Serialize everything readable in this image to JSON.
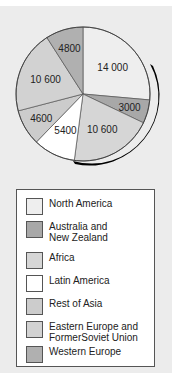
{
  "chart_data": {
    "type": "pie",
    "title": "",
    "categories": [
      "North America",
      "Australia and New Zealand",
      "Africa",
      "Latin America",
      "Rest of Asia",
      "Eastern Europe and FormerSoviet Union",
      "Western Europe"
    ],
    "values": [
      14000,
      3000,
      10600,
      5400,
      4600,
      10600,
      4800
    ],
    "labels": [
      "14 000",
      "3000",
      "10 600",
      "5400",
      "4600",
      "10 600",
      "4800"
    ],
    "colors": [
      "#eeeeee",
      "#a8a8a8",
      "#d6d6d6",
      "#ffffff",
      "#cccccc",
      "#d2d2d2",
      "#b0b0b0"
    ],
    "legend_position": "bottom"
  },
  "legend": {
    "items": [
      {
        "label": "North America",
        "color": "#eeeeee"
      },
      {
        "label": "Australia and\nNew  Zealand",
        "color": "#a8a8a8"
      },
      {
        "label": "Africa",
        "color": "#d6d6d6"
      },
      {
        "label": "Latin America",
        "color": "#ffffff"
      },
      {
        "label": "Rest of Asia",
        "color": "#cccccc"
      },
      {
        "label": "Eastern Europe and\nFormerSoviet Union",
        "color": "#d2d2d2"
      },
      {
        "label": "Western Europe",
        "color": "#b0b0b0"
      }
    ]
  }
}
